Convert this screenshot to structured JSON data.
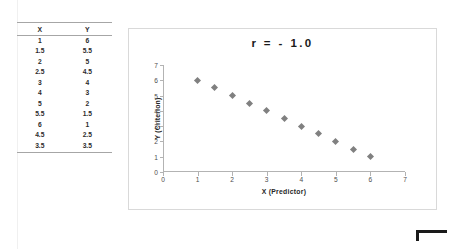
{
  "table": {
    "headers": [
      "X",
      "Y"
    ],
    "rows": [
      [
        "1",
        "6"
      ],
      [
        "1.5",
        "5.5"
      ],
      [
        "2",
        "5"
      ],
      [
        "2.5",
        "4.5"
      ],
      [
        "3",
        "4"
      ],
      [
        "4",
        "3"
      ],
      [
        "5",
        "2"
      ],
      [
        "5.5",
        "1.5"
      ],
      [
        "6",
        "1"
      ],
      [
        "4.5",
        "2.5"
      ],
      [
        "3.5",
        "3.5"
      ]
    ]
  },
  "chart_data": {
    "type": "scatter",
    "title": "r  =  - 1.0",
    "xlabel": "X  (Predictor)",
    "ylabel": "Y (Criterion)",
    "xlim": [
      0,
      7
    ],
    "ylim": [
      0,
      7
    ],
    "xticks": [
      "0",
      "1",
      "2",
      "3",
      "4",
      "5",
      "6",
      "7"
    ],
    "yticks": [
      "0",
      "1",
      "2",
      "3",
      "4",
      "5",
      "6",
      "7"
    ],
    "grid": false,
    "legend": null,
    "marker": "diamond",
    "marker_color": "#808080",
    "series": [
      {
        "name": "Y vs X",
        "x": [
          1,
          1.5,
          2,
          2.5,
          3,
          3.5,
          4,
          4.5,
          5,
          5.5,
          6
        ],
        "y": [
          6,
          5.5,
          5,
          4.5,
          4,
          3.5,
          3,
          2.5,
          2,
          1.5,
          1
        ]
      }
    ]
  },
  "marks": {
    "corner_bracket": "corner-bracket"
  }
}
